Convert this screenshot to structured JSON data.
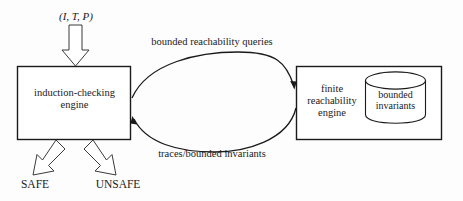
{
  "diagram": {
    "background_color": "#fdfdfd",
    "stroke_color": "#1a1a1a",
    "text_color": "#1a1a1a",
    "boxes": [
      {
        "id": "induction-checking-engine",
        "label": "induction-checking\nengine",
        "x": 17,
        "y": 66,
        "w": 114,
        "h": 74
      },
      {
        "id": "finite-reachability-engine",
        "label": "finite\nreachability\nengine",
        "x": 296,
        "y": 66,
        "w": 146,
        "h": 74
      }
    ],
    "cylinder": {
      "id": "bounded-invariants-store",
      "label": "bounded\ninvariants",
      "x": 365,
      "y": 72,
      "w": 61,
      "h": 51
    },
    "input": {
      "label": "(I, T, P)",
      "arrow_direction": "down",
      "target": "induction-checking-engine"
    },
    "flows": [
      {
        "id": "top-flow",
        "label": "bounded reachability queries",
        "from": "induction-checking-engine",
        "to": "finite-reachability-engine",
        "direction": "left-to-right"
      },
      {
        "id": "bottom-flow",
        "label": "traces/bounded invariants",
        "from": "finite-reachability-engine",
        "to": "induction-checking-engine",
        "direction": "right-to-left"
      }
    ],
    "outputs": [
      {
        "id": "safe-output",
        "label": "SAFE",
        "arrow_direction": "down-left"
      },
      {
        "id": "unsafe-output",
        "label": "UNSAFE",
        "arrow_direction": "down-right"
      }
    ]
  }
}
